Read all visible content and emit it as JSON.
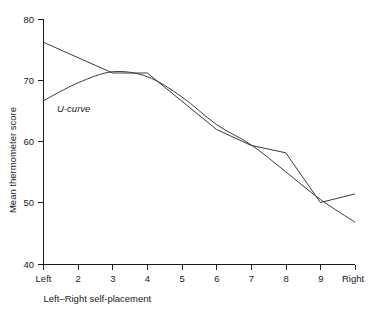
{
  "chart_data": {
    "type": "line",
    "title": "",
    "subtitle": "",
    "xlabel": "Left–Right self-placement",
    "ylabel": "Mean thermometer score",
    "categories": [
      "Left",
      "2",
      "3",
      "4",
      "5",
      "6",
      "7",
      "8",
      "9",
      "Right"
    ],
    "x_tick_labels": [
      "Left",
      "2",
      "3",
      "4",
      "5",
      "6",
      "7",
      "8",
      "9",
      "Right"
    ],
    "y_tick_labels": [
      "40",
      "50",
      "60",
      "70",
      "80"
    ],
    "y_ticks": [
      40,
      50,
      60,
      70,
      80
    ],
    "ylim": [
      40,
      80
    ],
    "xlim": [
      0,
      9
    ],
    "grid": false,
    "legend": false,
    "legend_position": "none",
    "series": [
      {
        "name": "Observed means",
        "style": "piecewise-linear",
        "values": [
          76.2,
          73.7,
          71.2,
          71.2,
          66.6,
          62.0,
          59.4,
          58.2,
          50.1,
          51.5
        ]
      },
      {
        "name": "U-curve",
        "style": "smooth-fit",
        "values": [
          66.7,
          69.6,
          71.4,
          70.6,
          67.3,
          62.8,
          59.5,
          55.1,
          50.6,
          46.9
        ]
      }
    ],
    "annotations": [
      {
        "text": "U-curve",
        "style": "italic",
        "x_category": "2",
        "y_value": 65.5
      }
    ],
    "colors": {
      "line": "#3a3a3a",
      "axis": "#1a1a1a",
      "background": "#ffffff",
      "text": "#1a1a1a"
    }
  },
  "axes": {
    "x_title": "Left–Right self-placement",
    "y_title": "Mean thermometer score"
  }
}
